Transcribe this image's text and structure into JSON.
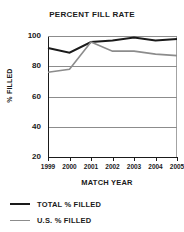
{
  "chart_data": {
    "type": "line",
    "title": "PERCENT FILL RATE",
    "xlabel": "MATCH YEAR",
    "ylabel": "% FILLED",
    "categories": [
      "1999",
      "2000",
      "2001",
      "2002",
      "2003",
      "2004",
      "2005"
    ],
    "x": [
      1999,
      2000,
      2001,
      2002,
      2003,
      2004,
      2005
    ],
    "ylim": [
      20,
      100
    ],
    "xlim": [
      1999,
      2005
    ],
    "yticks": [
      100,
      80,
      60,
      40,
      20
    ],
    "ytick_labels": [
      "100",
      "80",
      "60",
      "40",
      "20"
    ],
    "xtick_labels": [
      "1999",
      "2000",
      "2001",
      "2002",
      "2003",
      "2004",
      "2005"
    ],
    "grid": true,
    "grid_axis": "y",
    "grid_color": "#8c8c8c",
    "legend_position": "below",
    "series": [
      {
        "name": "TOTAL % FILLED",
        "color": "#1a1a1a",
        "width": 2.0,
        "values": [
          92,
          89,
          96,
          97,
          99,
          97,
          98
        ]
      },
      {
        "name": "U.S. % FILLED",
        "color": "#8c8c8c",
        "width": 1.6,
        "values": [
          76,
          78,
          96,
          90,
          90,
          88,
          87
        ]
      }
    ]
  },
  "legend": {
    "entries": [
      {
        "label": "TOTAL % FILLED",
        "color": "#1a1a1a",
        "width": "2.2px"
      },
      {
        "label": "U.S. % FILLED",
        "color": "#8c8c8c",
        "width": "1.8px"
      }
    ]
  },
  "colors": {
    "background": "#ffffff",
    "axis": "#1a1a1a",
    "grid": "#8c8c8c",
    "total_series": "#1a1a1a",
    "us_series": "#8c8c8c",
    "text": "#1a1a1a"
  }
}
